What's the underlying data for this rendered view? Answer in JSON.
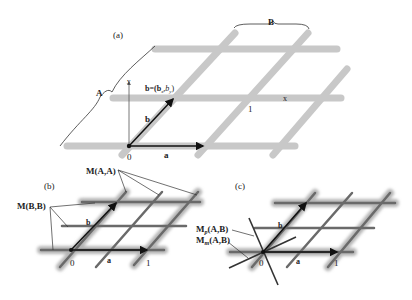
{
  "panels": {
    "a": {
      "label": "(a)",
      "brace_top": "B",
      "brace_left": "A",
      "axis_y": "y",
      "axis_x": "x",
      "vector_a": "a",
      "vector_b": "b",
      "b_coords": "b=(b",
      "b_sub_x": "x",
      "b_sep": ",b",
      "b_sub_y": "y",
      "b_close": ")",
      "origin": "0",
      "unit": "1"
    },
    "b": {
      "label": "(b)",
      "callout_top": "M(A,A)",
      "callout_left": "M(B,B)",
      "vector_a": "a",
      "vector_b": "b",
      "origin": "0",
      "unit": "1"
    },
    "c": {
      "label": "(c)",
      "callout_p_main": "M",
      "callout_p_sub": "p",
      "callout_p_args": "(A,B)",
      "callout_m_main": "M",
      "callout_m_sub": "m",
      "callout_m_args": "(A,B)",
      "vector_a": "a",
      "vector_b": "b",
      "origin": "0",
      "unit": "1"
    }
  },
  "colors": {
    "lattice_light": "#c8c8c8",
    "lattice_halo": "#bdbdbd",
    "lattice_dark": "#6e6e6e",
    "ink": "#111111"
  }
}
